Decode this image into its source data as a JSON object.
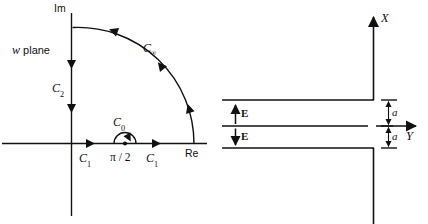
{
  "figure": {
    "title": "",
    "stroke_color": "#111111",
    "background_color": "#ffffff"
  },
  "left_panel": {
    "name": "w-plane contour diagram",
    "plane_label_prefix": "w",
    "plane_label_suffix": " plane",
    "axis_imaginary_label": "Im",
    "axis_real_label": "Re",
    "contours": [
      {
        "id": "C1a",
        "base": "C",
        "subscript": "1"
      },
      {
        "id": "C1b",
        "base": "C",
        "subscript": "1"
      },
      {
        "id": "C2",
        "base": "C",
        "subscript": "2"
      },
      {
        "id": "C0",
        "base": "C",
        "subscript": "0"
      },
      {
        "id": "Cinf",
        "base": "C",
        "subscript": "∞"
      }
    ],
    "pole_label": "π / 2",
    "pole_marker": "dot"
  },
  "right_panel": {
    "name": "parallel plate capacitor geometry",
    "axis_x_label": "X",
    "axis_y_label": "Y",
    "field_labels": [
      {
        "id": "E-up",
        "text": "E",
        "direction": "up"
      },
      {
        "id": "E-down",
        "text": "E",
        "direction": "down"
      }
    ],
    "dimensions": [
      {
        "id": "a-upper",
        "text": "a"
      },
      {
        "id": "a-lower",
        "text": "a"
      }
    ]
  }
}
